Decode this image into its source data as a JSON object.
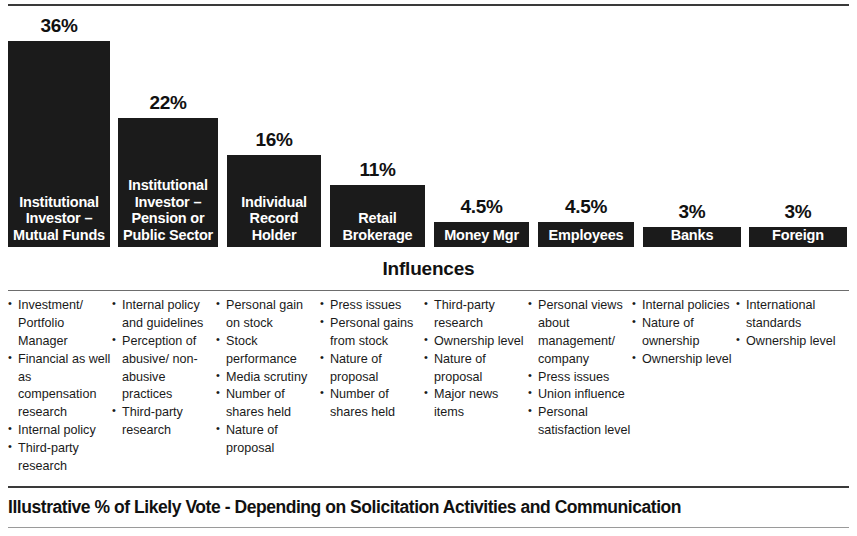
{
  "chart_data": {
    "type": "bar",
    "title": "Illustrative % of Likely Vote - Depending on Solicitation Activities and Communication",
    "xlabel": "",
    "ylabel": "",
    "ylim": [
      0,
      36
    ],
    "grid": false,
    "legend": "none",
    "categories": [
      "Institutional Investor – Mutual Funds",
      "Institutional Investor – Pension or Public Sector",
      "Individual Record Holder",
      "Retail Brokerage",
      "Money Mgr",
      "Employees",
      "Banks",
      "Foreign"
    ],
    "values": [
      36,
      22,
      16,
      11,
      4.5,
      4.5,
      3,
      3
    ],
    "value_labels": [
      "36%",
      "22%",
      "16%",
      "11%",
      "4.5%",
      "4.5%",
      "3%",
      "3%"
    ]
  },
  "bars": [
    {
      "value_label": "36%",
      "label_top": "Institutional Investor –",
      "label_bottom": "Mutual Funds",
      "left": 8,
      "width": 102,
      "height": 206
    },
    {
      "value_label": "22%",
      "label_top": "Institutional Investor –",
      "label_bottom": "Pension or Public Sector",
      "left": 118,
      "width": 100,
      "height": 129
    },
    {
      "value_label": "16%",
      "label_top": "",
      "label_bottom": "Individual Record Holder",
      "left": 227,
      "width": 94,
      "height": 92
    },
    {
      "value_label": "11%",
      "label_top": "",
      "label_bottom": "Retail Brokerage",
      "left": 330,
      "width": 95,
      "height": 62
    },
    {
      "value_label": "4.5%",
      "label_top": "",
      "label_bottom": "Money Mgr",
      "left": 434,
      "width": 95,
      "height": 25
    },
    {
      "value_label": "4.5%",
      "label_top": "",
      "label_bottom": "Employees",
      "left": 538,
      "width": 96,
      "height": 25
    },
    {
      "value_label": "3%",
      "label_top": "",
      "label_bottom": "Banks",
      "left": 643,
      "width": 98,
      "height": 20
    },
    {
      "value_label": "3%",
      "label_top": "",
      "label_bottom": "Foreign",
      "left": 749,
      "width": 98,
      "height": 20
    }
  ],
  "influences": {
    "heading": "Influences",
    "columns": [
      {
        "items": [
          "Investment/ Portfolio Manager",
          "Financial as well as compensation research",
          "Internal policy",
          "Third-party research"
        ]
      },
      {
        "items": [
          "Internal policy and guidelines",
          "Perception of abusive/ non-abusive practices",
          "Third-party research"
        ]
      },
      {
        "items": [
          "Personal gain on stock",
          "Stock performance",
          "Media scrutiny",
          "Number of shares held",
          "Nature of proposal"
        ]
      },
      {
        "items": [
          "Press issues",
          "Personal gains from stock",
          "Nature of proposal",
          "Number of shares held"
        ]
      },
      {
        "items": [
          "Third-party research",
          "Ownership level",
          "Nature of proposal",
          "Major news items"
        ]
      },
      {
        "items": [
          "Personal views about management/ company",
          "Press issues",
          "Union influence",
          "Personal satisfaction level"
        ]
      },
      {
        "items": [
          "Internal policies",
          "Nature of ownership",
          "Ownership level"
        ]
      },
      {
        "items": [
          "International standards",
          "Ownership level"
        ]
      }
    ]
  },
  "footer": {
    "title": "Illustrative % of Likely Vote - Depending on Solicitation Activities and Communication"
  },
  "colors": {
    "bar_fill": "#1b1b1b",
    "bar_text": "#ffffff",
    "rule": "#3a3a3a",
    "body_text": "#1a1a1a"
  }
}
